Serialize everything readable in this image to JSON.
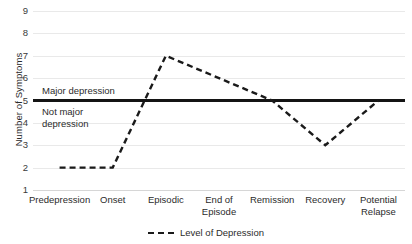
{
  "chart_data": {
    "type": "line",
    "title": "",
    "xlabel": "",
    "ylabel": "Number of Symptoms",
    "ylim": [
      1,
      9
    ],
    "yticks": [
      1,
      2,
      3,
      4,
      5,
      6,
      7,
      8,
      9
    ],
    "grid": true,
    "legend_position": "bottom-center",
    "categories": [
      "Predepression",
      "Onset",
      "Episodic",
      "End of\nEpisode",
      "Remission",
      "Recovery",
      "Potential\nRelapse"
    ],
    "series": [
      {
        "name": "Level of Depression",
        "style": "dashed",
        "color": "#1a1a1a",
        "values": [
          2,
          2,
          7,
          6,
          5,
          3,
          5
        ]
      }
    ],
    "threshold_line": {
      "value": 5,
      "style": "solid",
      "color": "#141414",
      "above_label": "Major depression",
      "below_label": "Not major\ndepression"
    }
  },
  "legend": {
    "items": [
      {
        "label": "Level of Depression",
        "marker": "dashed-line-marker"
      }
    ]
  }
}
